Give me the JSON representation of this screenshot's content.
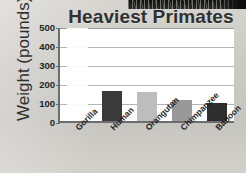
{
  "chart_data": {
    "type": "bar",
    "title": "Heaviest Primates",
    "xlabel": "",
    "ylabel": "Weight (pounds)",
    "ylim": [
      0,
      500
    ],
    "ytick_step": 100,
    "yticks": [
      500,
      400,
      300,
      200,
      100,
      0
    ],
    "grid": true,
    "legend": "none",
    "categories": [
      "Gorilla",
      "Human",
      "Orangutan",
      "Chimpanzee",
      "Baboon"
    ],
    "values": [
      null,
      160,
      155,
      110,
      95
    ],
    "bar_colors": [
      "#ffffff",
      "#3a3a3a",
      "#bdbdbd",
      "#999999",
      "#2e2e2e"
    ]
  },
  "chart": {
    "title": "Heaviest Primates",
    "y_axis_title": "Weight (pounds)",
    "y_ticks": [
      {
        "label": "500",
        "value": 500
      },
      {
        "label": "400",
        "value": 400
      },
      {
        "label": "300",
        "value": 300
      },
      {
        "label": "200",
        "value": 200
      },
      {
        "label": "100",
        "value": 100
      },
      {
        "label": "0",
        "value": 0
      }
    ],
    "bars": [
      {
        "label": "Gorilla",
        "value": null,
        "color": "#ffffff",
        "blank": true
      },
      {
        "label": "Human",
        "value": 160,
        "color": "#3a3a3a",
        "blank": false
      },
      {
        "label": "Orangutan",
        "value": 155,
        "color": "#bdbdbd",
        "blank": false
      },
      {
        "label": "Chimpanzee",
        "value": 110,
        "color": "#999999",
        "blank": false
      },
      {
        "label": "Baboon",
        "value": 95,
        "color": "#2e2e2e",
        "blank": false
      }
    ]
  }
}
